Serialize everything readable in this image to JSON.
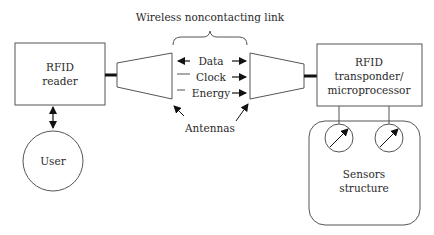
{
  "diagram": {
    "title": "Wireless noncontacting link",
    "nodes": {
      "reader": {
        "line1": "RFID",
        "line2": "reader"
      },
      "user": {
        "label": "User"
      },
      "transponder": {
        "line1": "RFID",
        "line2": "transponder/",
        "line3": "microprocessor"
      },
      "sensors": {
        "line1": "Sensors",
        "line2": "structure"
      }
    },
    "signals": [
      {
        "label": "Data",
        "direction": "bidirectional"
      },
      {
        "label": "Clock",
        "direction": "reader-to-transponder"
      },
      {
        "label": "Energy",
        "direction": "reader-to-transponder"
      }
    ],
    "antennas_label": "Antennas",
    "edges": [
      {
        "from": "reader",
        "to": "user",
        "type": "bidirectional-arrow"
      },
      {
        "from": "reader",
        "to": "left-antenna",
        "type": "thick-connector"
      },
      {
        "from": "right-antenna",
        "to": "transponder",
        "type": "thick-connector"
      },
      {
        "from": "transponder",
        "to": "sensor-1",
        "type": "line"
      },
      {
        "from": "transponder",
        "to": "sensor-2",
        "type": "line"
      }
    ]
  }
}
